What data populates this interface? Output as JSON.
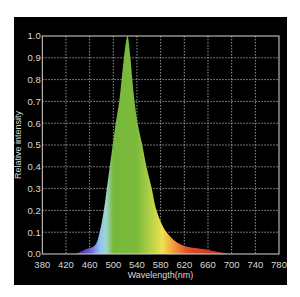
{
  "chart_data": {
    "type": "area",
    "title": "",
    "xlabel": "Wavelength(nm)",
    "ylabel": "Relative intensity",
    "xlim": [
      380,
      780
    ],
    "ylim": [
      0.0,
      1.0
    ],
    "grid": true,
    "legend": null,
    "x_ticks": [
      "380",
      "420",
      "460",
      "500",
      "540",
      "580",
      "620",
      "660",
      "700",
      "740",
      "780"
    ],
    "y_ticks": [
      "0.0",
      "0.1",
      "0.2",
      "0.3",
      "0.4",
      "0.5",
      "0.6",
      "0.7",
      "0.8",
      "0.9",
      "1.0"
    ],
    "series": [
      {
        "name": "Spectrum",
        "peak_nm": 524,
        "x": [
          435,
          452,
          469,
          477,
          484,
          489,
          494,
          499,
          504,
          510,
          514,
          518,
          524,
          529,
          532,
          536,
          541,
          549,
          556,
          565,
          573,
          590,
          617,
          658,
          697
        ],
        "values": [
          0.0,
          0.02,
          0.04,
          0.1,
          0.2,
          0.3,
          0.4,
          0.5,
          0.6,
          0.7,
          0.8,
          0.9,
          1.0,
          0.9,
          0.8,
          0.7,
          0.6,
          0.5,
          0.4,
          0.3,
          0.2,
          0.1,
          0.04,
          0.02,
          0.0
        ]
      }
    ],
    "fill_gradient": [
      {
        "nm": 435,
        "color": "#3a1f8a"
      },
      {
        "nm": 460,
        "color": "#6a5ad0"
      },
      {
        "nm": 478,
        "color": "#8cc6f2"
      },
      {
        "nm": 488,
        "color": "#9fd6c8"
      },
      {
        "nm": 500,
        "color": "#76b83a"
      },
      {
        "nm": 540,
        "color": "#7dbb3c"
      },
      {
        "nm": 565,
        "color": "#b9d246"
      },
      {
        "nm": 583,
        "color": "#f0e050"
      },
      {
        "nm": 600,
        "color": "#f2a238"
      },
      {
        "nm": 625,
        "color": "#e0502a"
      },
      {
        "nm": 697,
        "color": "#c02418"
      }
    ]
  },
  "colors": {
    "background": "#000000",
    "grid": "#bdbdbd",
    "axis": "#d8d8d8",
    "text": "#d8d8d8"
  }
}
